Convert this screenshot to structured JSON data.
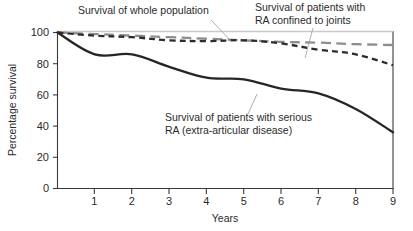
{
  "chart_data": {
    "type": "line",
    "title": "",
    "xlabel": "Years",
    "ylabel": "Percentage survival",
    "xlim": [
      0,
      9
    ],
    "ylim": [
      0,
      100
    ],
    "xticks": [
      "0",
      "1",
      "2",
      "3",
      "4",
      "5",
      "6",
      "7",
      "8",
      "9"
    ],
    "yticks": [
      "0",
      "20",
      "40",
      "60",
      "80",
      "100"
    ],
    "grid": false,
    "legend_position": "annotations-inline",
    "x": [
      0,
      1,
      2,
      3,
      4,
      5,
      6,
      7,
      8,
      9
    ],
    "series": [
      {
        "name": "Survival of whole population",
        "style": "long-dashed",
        "color": "#8d8d8d",
        "values": [
          100,
          99,
          98,
          97,
          96,
          95,
          94,
          93.5,
          92.5,
          92
        ]
      },
      {
        "name": "Survival of patients with RA confined to joints",
        "style": "short-dashed",
        "color": "#2c2c2c",
        "values": [
          100,
          98,
          97,
          95,
          94.5,
          95,
          93,
          89,
          86,
          79
        ]
      },
      {
        "name": "Survival of patients with serious RA (extra-articular disease)",
        "style": "solid",
        "color": "#262626",
        "values": [
          100,
          86,
          86,
          78,
          71,
          70,
          64,
          61,
          51,
          36
        ]
      }
    ],
    "annotations": [
      {
        "id": "whole-population",
        "lines": [
          "Survival of whole population"
        ],
        "x": 78,
        "y": 14,
        "leader": "M 211 20 L 232 42"
      },
      {
        "id": "ra-confined-to-joints",
        "lines": [
          "Survival of patients with",
          "RA confined to joints"
        ],
        "x": 255,
        "y": 10,
        "leader": "M 313 28 L 305 58"
      },
      {
        "id": "serious-ra",
        "lines": [
          "Survival of patients with serious",
          "RA (extra-articular disease)"
        ],
        "x": 165,
        "y": 117,
        "leader": "M 248 114 L 257 94"
      }
    ]
  },
  "colors": {
    "axis": "#3a3a3a",
    "text": "#2b2b2b",
    "leader": "#9a9a9a",
    "top_reference_line": "#c9c9c9",
    "background": "#ffffff"
  }
}
